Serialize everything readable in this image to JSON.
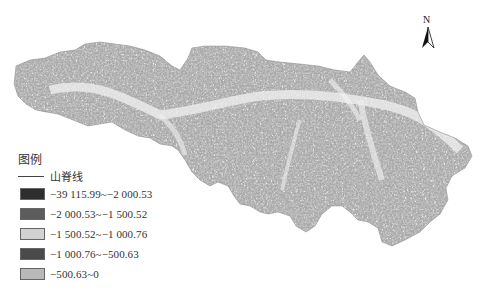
{
  "map": {
    "description": "Grayscale terrain / gully density map of a basin with ridge lines",
    "north_arrow": {
      "label": "N"
    },
    "legend": {
      "title": "图例",
      "ridge_line_label": "山脊线",
      "ridge_line_color": "#444444",
      "items": [
        {
          "label": "−39 115.99~−2 000.53",
          "color": "#2e2e2e"
        },
        {
          "label": "−2 000.53~−1 500.52",
          "color": "#5c5c5c"
        },
        {
          "label": "−1 500.52~−1 000.76",
          "color": "#d2d2d2"
        },
        {
          "label": "−1 000.76~−500.63",
          "color": "#4a4a4a"
        },
        {
          "label": "−500.63~0",
          "color": "#b9b9b9"
        }
      ]
    }
  }
}
